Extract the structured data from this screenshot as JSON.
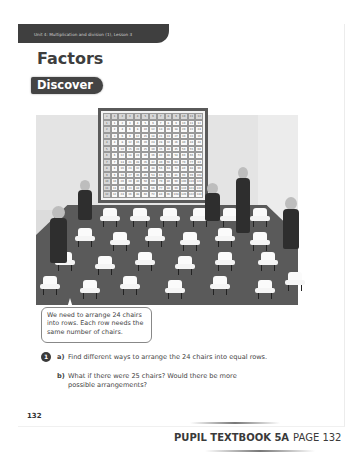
{
  "header": {
    "unit_label": "Unit 4: Multiplication and division (1), Lesson 3"
  },
  "title": "Factors",
  "section_tab": "Discover",
  "illustration": {
    "description": "Classroom scene with multiplication grid on wall, children and empty chairs",
    "grid_header": [
      "×",
      "1",
      "2",
      "3",
      "4",
      "5",
      "6",
      "7",
      "8",
      "9",
      "10",
      "11",
      "12"
    ],
    "grid_size": 12
  },
  "speech_bubble": "We need to arrange 24 chairs into rows. Each row needs the same number of chairs.",
  "question": {
    "number": "1",
    "parts": [
      {
        "label": "a)",
        "text": "Find different ways to arrange the 24 chairs into equal rows."
      },
      {
        "label": "b)",
        "text": "What if there were 25 chairs? Would there be more possible arrangements?"
      }
    ]
  },
  "page_number": "132",
  "footer": {
    "book": "PUPIL TEXTBOOK 5A",
    "page": "PAGE 132"
  }
}
